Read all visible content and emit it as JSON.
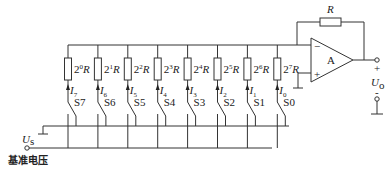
{
  "diagram": {
    "reference_label": "基准电压",
    "reference_symbol": "U",
    "reference_subscript": "s",
    "output_symbol": "U",
    "output_subscript": "o",
    "output_plus": "+",
    "output_minus": "-",
    "opamp_label": "A",
    "opamp_minus": "−",
    "opamp_plus": "+",
    "feedback_resistor": "R",
    "branches": [
      {
        "resistor_exp": "0",
        "current_sub": "7",
        "switch": "S7"
      },
      {
        "resistor_exp": "1",
        "current_sub": "6",
        "switch": "S6"
      },
      {
        "resistor_exp": "2",
        "current_sub": "5",
        "switch": "S5"
      },
      {
        "resistor_exp": "3",
        "current_sub": "4",
        "switch": "S4"
      },
      {
        "resistor_exp": "4",
        "current_sub": "3",
        "switch": "S3"
      },
      {
        "resistor_exp": "5",
        "current_sub": "2",
        "switch": "S2"
      },
      {
        "resistor_exp": "6",
        "current_sub": "1",
        "switch": "S1"
      },
      {
        "resistor_exp": "7",
        "current_sub": "0",
        "switch": "S0"
      }
    ]
  }
}
